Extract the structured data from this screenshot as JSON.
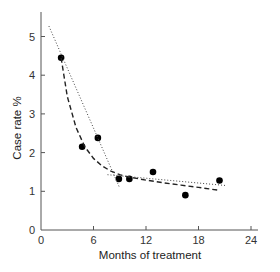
{
  "chart_data": {
    "type": "scatter",
    "title": "",
    "xlabel": "Months of treatment",
    "ylabel": "Case rate %",
    "xlim": [
      0,
      25
    ],
    "ylim": [
      0,
      5.6
    ],
    "xticks": [
      0,
      6,
      12,
      18,
      24
    ],
    "yticks": [
      0,
      1,
      2,
      3,
      4,
      5
    ],
    "grid": false,
    "legend": null,
    "series": [
      {
        "name": "observed case rate",
        "kind": "points",
        "color": "#000000",
        "x": [
          2.3,
          4.7,
          6.5,
          8.9,
          10.1,
          12.8,
          16.5,
          20.4
        ],
        "y": [
          4.45,
          2.15,
          2.38,
          1.32,
          1.32,
          1.5,
          0.9,
          1.28
        ]
      },
      {
        "name": "exponential decay fit",
        "kind": "dashed-curve",
        "color": "#222222",
        "x": [
          2.3,
          3.0,
          4.0,
          5.0,
          6.0,
          7.0,
          8.0,
          9.0,
          10.0,
          12.0,
          14.0,
          16.0,
          18.0,
          20.2
        ],
        "y": [
          4.45,
          3.45,
          2.65,
          2.15,
          1.85,
          1.65,
          1.52,
          1.43,
          1.37,
          1.29,
          1.22,
          1.16,
          1.1,
          1.03
        ]
      },
      {
        "name": "early phase linear trend",
        "kind": "dotted-line",
        "color": "#444444",
        "x": [
          0.9,
          9.0
        ],
        "y": [
          5.27,
          1.08
        ]
      },
      {
        "name": "late phase linear trend",
        "kind": "dotted-line",
        "color": "#444444",
        "x": [
          7.6,
          21.1
        ],
        "y": [
          1.43,
          1.15
        ]
      }
    ]
  },
  "axes": {
    "x_title": "Months of treatment",
    "y_title": "Case rate %",
    "x_tick_labels": [
      "0",
      "6",
      "12",
      "18",
      "24"
    ],
    "y_tick_labels": [
      "0",
      "1",
      "2",
      "3",
      "4",
      "5"
    ]
  }
}
